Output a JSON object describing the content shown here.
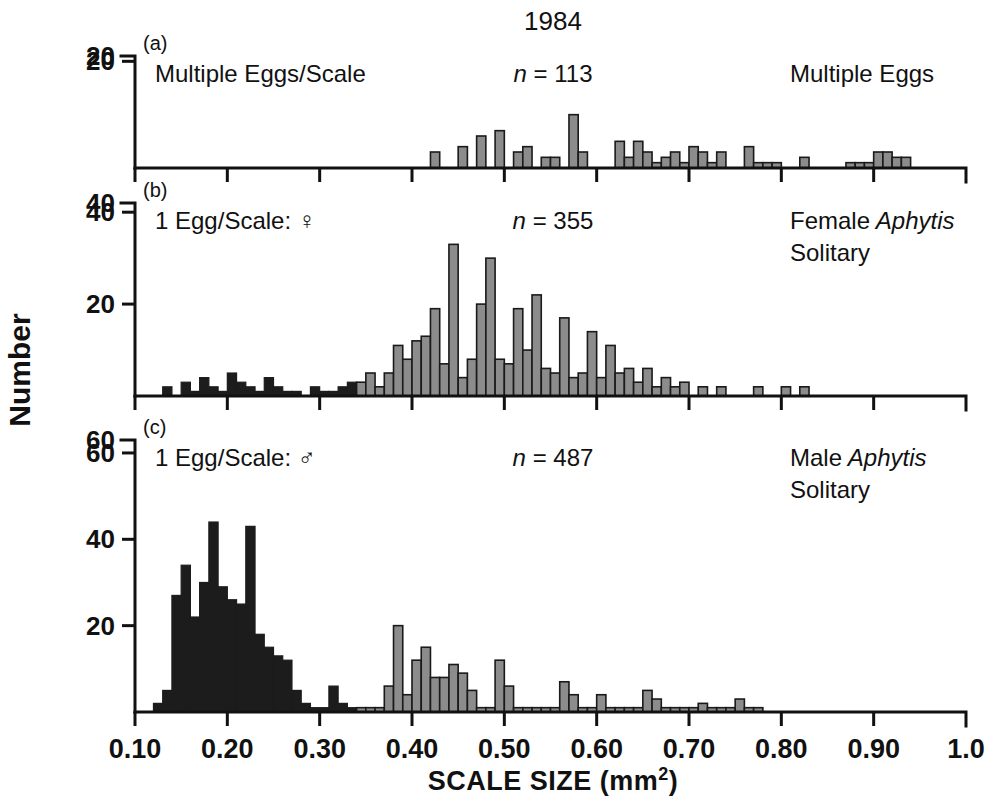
{
  "figure": {
    "title": "1984",
    "y_axis_label": "Number",
    "x_axis_title": "SCALE SIZE (mm",
    "x_axis_title_sup": "2",
    "x_axis_title_close": ")",
    "colors": {
      "grey_bar": "#8c8c8c",
      "dark_bar": "#1c1c1c",
      "axis": "#111111",
      "background": "#ffffff"
    },
    "x_ticks": [
      "0.10",
      "0.20",
      "0.30",
      "0.40",
      "0.50",
      "0.60",
      "0.70",
      "0.80",
      "0.90",
      "1.0"
    ],
    "x_tick_values": [
      0.1,
      0.2,
      0.3,
      0.4,
      0.5,
      0.6,
      0.7,
      0.8,
      0.9,
      1.0
    ]
  },
  "panels": [
    {
      "letter": "(a)",
      "left_label": "Multiple Eggs/Scale",
      "n_prefix": "n",
      "n_value": "= 113",
      "right_label_line1": "Multiple Eggs",
      "right_label_line2": "",
      "right_label_italic": "",
      "y_ticks": [
        "20"
      ],
      "y_tick_values": [
        20
      ],
      "y_max": 21
    },
    {
      "letter": "(b)",
      "left_label": "1 Egg/Scale: ♀",
      "n_prefix": "n",
      "n_value": "= 355",
      "right_label_line1": "Female",
      "right_label_italic": "Aphytis",
      "right_label_line2": "Solitary",
      "y_ticks": [
        "40",
        "20"
      ],
      "y_tick_values": [
        40,
        20
      ],
      "y_max": 42
    },
    {
      "letter": "(c)",
      "left_label": "1 Egg/Scale: ♂",
      "n_prefix": "n",
      "n_value": "= 487",
      "right_label_line1": "Male",
      "right_label_italic": "Aphytis",
      "right_label_line2": "Solitary",
      "y_ticks": [
        "60",
        "40",
        "20"
      ],
      "y_tick_values": [
        60,
        40,
        20
      ],
      "y_max": 63
    }
  ],
  "chart_data": {
    "type": "bar",
    "title": "1984",
    "xlabel": "SCALE SIZE (mm2)",
    "ylabel": "Number",
    "xlim": [
      0.1,
      1.0
    ],
    "bin_width": 0.01,
    "grid": false,
    "legend": "none",
    "panels": [
      {
        "id": "a",
        "label": "Multiple Eggs/Scale",
        "series_label": "Multiple Eggs",
        "n": 113,
        "ylim": [
          0,
          21
        ],
        "yticks": [
          0,
          20
        ],
        "bar_style": "grey",
        "x": [
          0.415,
          0.425,
          0.445,
          0.455,
          0.465,
          0.475,
          0.485,
          0.495,
          0.505,
          0.515,
          0.525,
          0.535,
          0.545,
          0.555,
          0.565,
          0.575,
          0.585,
          0.595,
          0.615,
          0.625,
          0.635,
          0.645,
          0.655,
          0.665,
          0.675,
          0.685,
          0.695,
          0.705,
          0.715,
          0.725,
          0.735,
          0.745,
          0.755,
          0.765,
          0.775,
          0.785,
          0.795,
          0.815,
          0.825,
          0.855,
          0.875,
          0.885,
          0.895,
          0.905,
          0.915,
          0.925,
          0.935,
          0.945
        ],
        "values": [
          0,
          3,
          0,
          4,
          0,
          6,
          0,
          7,
          0,
          3,
          4,
          0,
          2,
          2,
          0,
          10,
          3,
          0,
          0,
          5,
          2,
          5,
          3,
          1,
          2,
          3,
          1,
          4,
          3,
          1,
          3,
          0,
          0,
          4,
          1,
          1,
          1,
          0,
          2,
          0,
          1,
          1,
          1,
          3,
          3,
          2,
          2,
          0
        ]
      },
      {
        "id": "b",
        "label": "1 Egg/Scale: female",
        "series_label": "Female Aphytis Solitary",
        "n": 355,
        "ylim": [
          0,
          42
        ],
        "yticks": [
          0,
          20,
          40
        ],
        "bar_style": "dark-left-grey-right",
        "dark_grey_boundary": 0.345,
        "x": [
          0.135,
          0.155,
          0.165,
          0.175,
          0.185,
          0.195,
          0.205,
          0.215,
          0.225,
          0.235,
          0.245,
          0.255,
          0.265,
          0.275,
          0.285,
          0.295,
          0.305,
          0.315,
          0.325,
          0.335,
          0.345,
          0.355,
          0.365,
          0.375,
          0.385,
          0.395,
          0.405,
          0.415,
          0.425,
          0.435,
          0.445,
          0.455,
          0.465,
          0.475,
          0.485,
          0.495,
          0.505,
          0.515,
          0.525,
          0.535,
          0.545,
          0.555,
          0.565,
          0.575,
          0.585,
          0.595,
          0.605,
          0.615,
          0.625,
          0.635,
          0.645,
          0.655,
          0.665,
          0.675,
          0.685,
          0.695,
          0.715,
          0.735,
          0.775,
          0.805,
          0.825
        ],
        "values": [
          2,
          3,
          1,
          4,
          2,
          1,
          5,
          3,
          2,
          1,
          4,
          2,
          1,
          1,
          0,
          2,
          1,
          1,
          2,
          3,
          3,
          5,
          2,
          5,
          11,
          8,
          12,
          13,
          19,
          7,
          33,
          4,
          8,
          20,
          30,
          8,
          7,
          19,
          10,
          22,
          6,
          5,
          17,
          4,
          5,
          14,
          4,
          11,
          5,
          6,
          3,
          6,
          2,
          4,
          2,
          3,
          2,
          2,
          2,
          2,
          2
        ]
      },
      {
        "id": "c",
        "label": "1 Egg/Scale: male",
        "series_label": "Male Aphytis Solitary",
        "n": 487,
        "ylim": [
          0,
          63
        ],
        "yticks": [
          0,
          20,
          40,
          60
        ],
        "bar_style": "dark-left-grey-right",
        "dark_grey_boundary": 0.345,
        "x": [
          0.125,
          0.135,
          0.145,
          0.155,
          0.165,
          0.175,
          0.185,
          0.195,
          0.205,
          0.215,
          0.225,
          0.235,
          0.245,
          0.255,
          0.265,
          0.275,
          0.285,
          0.295,
          0.305,
          0.315,
          0.325,
          0.335,
          0.345,
          0.355,
          0.365,
          0.375,
          0.385,
          0.395,
          0.405,
          0.415,
          0.425,
          0.435,
          0.445,
          0.455,
          0.465,
          0.475,
          0.485,
          0.495,
          0.505,
          0.515,
          0.525,
          0.535,
          0.545,
          0.555,
          0.565,
          0.575,
          0.585,
          0.595,
          0.605,
          0.615,
          0.625,
          0.635,
          0.645,
          0.655,
          0.665,
          0.675,
          0.685,
          0.695,
          0.705,
          0.715,
          0.725,
          0.735,
          0.745,
          0.755,
          0.765,
          0.775,
          0.785
        ],
        "values": [
          2,
          5,
          27,
          34,
          22,
          30,
          44,
          29,
          26,
          25,
          43,
          18,
          15,
          13,
          12,
          5,
          2,
          1,
          1,
          6,
          2,
          1,
          1,
          1,
          1,
          6,
          20,
          4,
          12,
          15,
          8,
          8,
          11,
          9,
          5,
          1,
          1,
          12,
          6,
          1,
          1,
          1,
          1,
          1,
          7,
          4,
          1,
          1,
          4,
          1,
          1,
          1,
          1,
          5,
          3,
          1,
          1,
          1,
          1,
          2,
          1,
          1,
          1,
          3,
          1,
          1,
          0
        ]
      }
    ]
  }
}
